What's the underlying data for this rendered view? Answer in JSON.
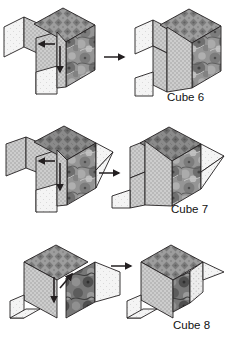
{
  "figure": {
    "background_color": "#ffffff",
    "ink_color": "#231f20",
    "rows": [
      {
        "id": "row-cube-6",
        "label": "Cube 6",
        "transition_icon": "right-arrow-icon",
        "left_panel_name": "cube-6-unfolded-net",
        "right_panel_name": "cube-6-folded-result",
        "fold_arrows": [
          "left-arrow-icon",
          "down-arrow-icon"
        ]
      },
      {
        "id": "row-cube-7",
        "label": "Cube 7",
        "transition_icon": "right-arrow-icon",
        "left_panel_name": "cube-7-unfolded-net",
        "right_panel_name": "cube-7-folded-result",
        "fold_arrows": [
          "left-arrow-icon",
          "down-arrow-icon"
        ]
      },
      {
        "id": "row-cube-8",
        "label": "Cube 8",
        "transition_icon": "right-arrow-icon",
        "left_panel_name": "cube-8-unfolded-net",
        "right_panel_name": "cube-8-folded-result",
        "fold_arrows": [
          "up-arrow-icon",
          "down-arrow-icon"
        ]
      }
    ],
    "face_textures": [
      {
        "name": "top-face-mosaic",
        "fill": "#9a9a9a",
        "pattern": "mosaic-diamond"
      },
      {
        "name": "left-face-dotted",
        "fill": "#c9c9c9",
        "pattern": "fine-dot-grid"
      },
      {
        "name": "front-face-floral",
        "fill": "#8f8f8f",
        "pattern": "floral-marble"
      },
      {
        "name": "blank-face-light",
        "fill": "#f2f2f2",
        "pattern": "sparse-dot"
      }
    ]
  }
}
